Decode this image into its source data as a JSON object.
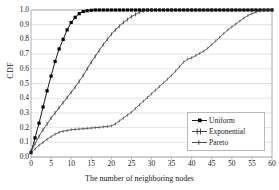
{
  "chart_data": {
    "type": "line",
    "title": "",
    "xlabel": "The number of neighboring nodes",
    "ylabel": "CDF",
    "xlim": [
      0,
      60
    ],
    "ylim": [
      0,
      1
    ],
    "grid": true,
    "grid_axis": "y",
    "legend_position": "bottom-right",
    "xticks": [
      0,
      5,
      10,
      15,
      20,
      25,
      30,
      35,
      40,
      45,
      50,
      55,
      60
    ],
    "xticklabels": [
      "0",
      "5",
      "10",
      "15",
      "20",
      "25",
      "30",
      "35",
      "40",
      "45",
      "50",
      "55",
      "60"
    ],
    "yticks": [
      0.0,
      0.1,
      0.2,
      0.3,
      0.4,
      0.5,
      0.6,
      0.7,
      0.8,
      0.9,
      1.0
    ],
    "yticklabels": [
      "0.0",
      "0.1",
      "0.2",
      "0.3",
      "0.4",
      "0.5",
      "0.6",
      "0.7",
      "0.8",
      "0.9",
      "1.0"
    ],
    "series": [
      {
        "name": "Uniform",
        "marker": "filled-square",
        "color": "#000000",
        "x": [
          0,
          1,
          2,
          3,
          4,
          5,
          6,
          7,
          8,
          9,
          10,
          11,
          12,
          13,
          14,
          15,
          16,
          17,
          18,
          19,
          20,
          21,
          22,
          23,
          24,
          25,
          26,
          27,
          28,
          29,
          30,
          31,
          32,
          33,
          34,
          35,
          36,
          37,
          38,
          39,
          40,
          41,
          42,
          43,
          44,
          45,
          46,
          47,
          48,
          49,
          50,
          51,
          52,
          53,
          54,
          55,
          56,
          57,
          58,
          59,
          60
        ],
        "y": [
          0.03,
          0.13,
          0.23,
          0.34,
          0.45,
          0.55,
          0.65,
          0.735,
          0.8,
          0.865,
          0.915,
          0.95,
          0.975,
          0.99,
          0.995,
          0.998,
          1.0,
          1.0,
          1.0,
          1.0,
          1.0,
          1.0,
          1.0,
          1.0,
          1.0,
          1.0,
          1.0,
          1.0,
          1.0,
          1.0,
          1.0,
          1.0,
          1.0,
          1.0,
          1.0,
          1.0,
          1.0,
          1.0,
          1.0,
          1.0,
          1.0,
          1.0,
          1.0,
          1.0,
          1.0,
          1.0,
          1.0,
          1.0,
          1.0,
          1.0,
          1.0,
          1.0,
          1.0,
          1.0,
          1.0,
          1.0,
          1.0,
          1.0,
          1.0,
          1.0,
          1.0
        ]
      },
      {
        "name": "Exponential",
        "marker": "tick",
        "color": "#2b2b2b",
        "x": [
          0,
          1,
          2,
          3,
          4,
          5,
          6,
          7,
          8,
          9,
          10,
          11,
          12,
          13,
          14,
          15,
          16,
          17,
          18,
          19,
          20,
          21,
          22,
          23,
          24,
          25,
          26,
          27,
          28,
          29,
          30,
          35,
          40,
          45,
          50,
          55,
          60
        ],
        "y": [
          0.04,
          0.09,
          0.14,
          0.185,
          0.225,
          0.265,
          0.3,
          0.335,
          0.37,
          0.405,
          0.44,
          0.475,
          0.515,
          0.555,
          0.6,
          0.645,
          0.685,
          0.725,
          0.765,
          0.8,
          0.835,
          0.865,
          0.89,
          0.915,
          0.935,
          0.955,
          0.97,
          0.985,
          0.995,
          1.0,
          1.0,
          1.0,
          1.0,
          1.0,
          1.0,
          1.0,
          1.0
        ]
      },
      {
        "name": "Pareto",
        "marker": "dash",
        "color": "#3a3a3a",
        "x": [
          0,
          1,
          2,
          3,
          4,
          5,
          6,
          7,
          8,
          9,
          10,
          11,
          12,
          13,
          14,
          15,
          16,
          17,
          18,
          19,
          20,
          21,
          22,
          23,
          24,
          25,
          26,
          27,
          28,
          29,
          30,
          31,
          32,
          33,
          34,
          35,
          36,
          37,
          38,
          39,
          40,
          41,
          42,
          43,
          44,
          45,
          46,
          47,
          48,
          49,
          50,
          51,
          52,
          53,
          54,
          55,
          56,
          57,
          58,
          59,
          60
        ],
        "y": [
          0.03,
          0.055,
          0.08,
          0.1,
          0.12,
          0.138,
          0.155,
          0.168,
          0.175,
          0.18,
          0.185,
          0.188,
          0.19,
          0.192,
          0.195,
          0.197,
          0.2,
          0.202,
          0.205,
          0.208,
          0.212,
          0.225,
          0.245,
          0.265,
          0.285,
          0.305,
          0.33,
          0.355,
          0.38,
          0.405,
          0.43,
          0.455,
          0.48,
          0.505,
          0.53,
          0.555,
          0.585,
          0.615,
          0.645,
          0.665,
          0.675,
          0.69,
          0.705,
          0.72,
          0.74,
          0.765,
          0.79,
          0.815,
          0.84,
          0.865,
          0.885,
          0.905,
          0.925,
          0.945,
          0.962,
          0.975,
          0.985,
          0.993,
          0.998,
          1.0,
          1.0
        ]
      }
    ]
  },
  "legend": {
    "entries": [
      {
        "label": "Uniform"
      },
      {
        "label": "Exponential"
      },
      {
        "label": "Pareto"
      }
    ]
  }
}
